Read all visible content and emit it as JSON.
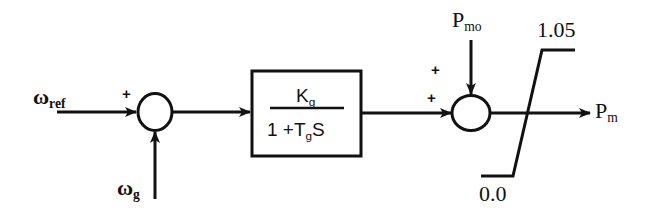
{
  "diagram": {
    "type": "control block diagram (governor / turbine model)",
    "colors": {
      "stroke": "#111111",
      "background": "#ffffff"
    },
    "inputs": {
      "omega_ref": {
        "symbol": "ω",
        "subscript": "ref"
      },
      "omega_g": {
        "symbol": "ω",
        "subscript": "g"
      },
      "p_mo": {
        "symbol": "P",
        "subscript": "mo"
      }
    },
    "summer1": {
      "signs": [
        "+"
      ]
    },
    "transfer_block": {
      "numerator": {
        "main": "K",
        "subscript": "g"
      },
      "denominator": {
        "prefix": "1 +T",
        "subscript": "g",
        "suffix": "S"
      }
    },
    "summer2": {
      "signs": [
        "+",
        "+"
      ]
    },
    "limiter": {
      "upper": "1.05",
      "lower": "0.0"
    },
    "output": {
      "symbol": "P",
      "subscript": "m"
    }
  }
}
